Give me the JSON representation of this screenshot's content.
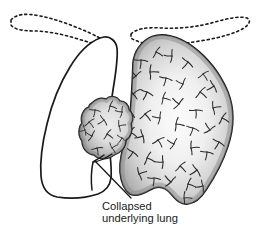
{
  "figure": {
    "background_color": "#ffffff",
    "width": 260,
    "height": 231
  },
  "annotation": {
    "line1": "Collapsed",
    "line2": "underlying lung",
    "text_color": "#1a1a1a"
  },
  "parts": {
    "left_pleural_cavity": {
      "name": "left lung cavity outline",
      "fill": "#ffffff",
      "stroke": "#1a1a1a"
    },
    "collapsed_lung": {
      "name": "collapsed underlying lung",
      "fill_light": "#e8e8e8",
      "fill_dark": "#9a9a9a",
      "stroke": "#1a1a1a"
    },
    "right_lung": {
      "name": "normal inflated lung",
      "fill_light": "#fbfbfb",
      "fill_dark": "#a8a8a8",
      "stroke": "#1a1a1a",
      "markings": "bronchial-branch-marks"
    },
    "clavicle_left": {
      "name": "left clavicle dashed outline",
      "stroke": "#1a1a1a",
      "style": "dashed"
    },
    "clavicle_right": {
      "name": "right clavicle dashed outline",
      "stroke": "#1a1a1a",
      "style": "dashed"
    },
    "leader_line": {
      "name": "annotation leader line",
      "stroke": "#1a1a1a"
    }
  }
}
